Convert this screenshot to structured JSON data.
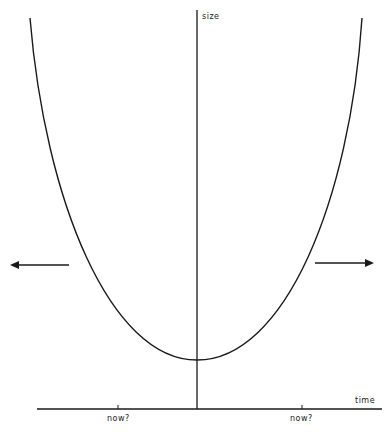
{
  "diagram": {
    "y_axis_label": "size",
    "x_axis_label": "time",
    "tick_labels": [
      "now?",
      "now?"
    ],
    "curve": "u-shaped parabola, vertex on the size axis near the bottom",
    "arrows": [
      {
        "direction": "left",
        "meaning": "left-pointing arrow outside left branch"
      },
      {
        "direction": "right",
        "meaning": "right-pointing arrow outside right branch"
      }
    ],
    "colors": {
      "line": "#1a1a1a",
      "background": "#ffffff"
    }
  }
}
